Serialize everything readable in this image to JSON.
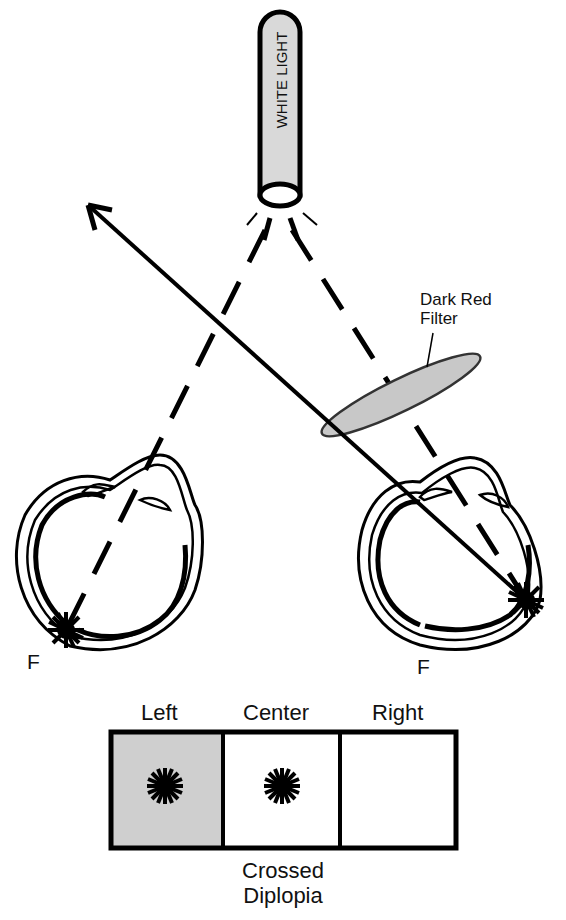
{
  "light_source": {
    "label": "WHITE LIGHT",
    "fill": "#d9d9d9"
  },
  "filter": {
    "label_line1": "Dark Red",
    "label_line2": "Filter",
    "fill": "#c8c8c8"
  },
  "eyes": {
    "left": {
      "fovea_label": "F"
    },
    "right": {
      "fovea_label": "F"
    }
  },
  "perception_box": {
    "columns": [
      {
        "label": "Left",
        "shaded": true,
        "has_image": true
      },
      {
        "label": "Center",
        "shaded": false,
        "has_image": true
      },
      {
        "label": "Right",
        "shaded": false,
        "has_image": false
      }
    ],
    "caption_line1": "Crossed",
    "caption_line2": "Diplopia",
    "shade_color": "#cfcfcf"
  }
}
